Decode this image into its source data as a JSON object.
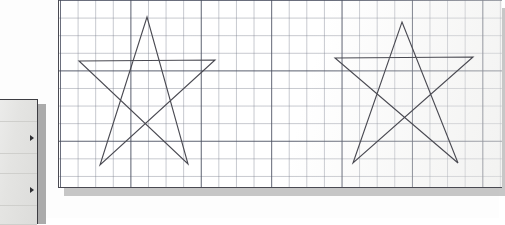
{
  "scene": {
    "title": "Graph paper sheet with two hand-drawn five-point stars",
    "background_color": "#fdfdfd"
  },
  "paper": {
    "name": "graph-paper-sheet",
    "background_color": "#ffffff",
    "border_color": "#4a4a52",
    "shadow_color": "#9a9a9a",
    "grid": {
      "fine_spacing_px": 17.6,
      "fine_line_color": "#787d8c",
      "major_every_n_cells": 4,
      "major_spacing_px": 70.4,
      "major_line_color": "#464b5c"
    },
    "bounds": {
      "x": 58,
      "y": -2,
      "width": 444,
      "height": 190
    }
  },
  "drawings": [
    {
      "name": "star-left",
      "label": "Left five-pointed star",
      "stroke_color": "#4a4a52",
      "stroke_width": 1.1,
      "points": [
        [
          147,
          17
        ],
        [
          188,
          164
        ],
        [
          79,
          61
        ],
        [
          215,
          60
        ],
        [
          100,
          165
        ]
      ]
    },
    {
      "name": "star-right",
      "label": "Right five-pointed star",
      "stroke_color": "#4a4a52",
      "stroke_width": 1.1,
      "points": [
        [
          402,
          22
        ],
        [
          458,
          163
        ],
        [
          335,
          58
        ],
        [
          473,
          57
        ],
        [
          353,
          163
        ]
      ]
    }
  ],
  "panel": {
    "name": "left-side-panel",
    "background_color": "#e6e6e4",
    "border_color": "#3d3d42",
    "divider_color": "#cfcfcc",
    "shadow_color": "#8f8f8f",
    "rows": [
      {
        "label": "",
        "arrow": false,
        "top": 0,
        "height": 22
      },
      {
        "label": "",
        "arrow": true,
        "top": 22,
        "height": 32
      },
      {
        "label": "",
        "arrow": false,
        "top": 54,
        "height": 20
      },
      {
        "label": "",
        "arrow": true,
        "top": 74,
        "height": 32
      },
      {
        "label": "",
        "arrow": false,
        "top": 106,
        "height": 19
      }
    ],
    "arrow_icon": "triangle-right-icon"
  }
}
